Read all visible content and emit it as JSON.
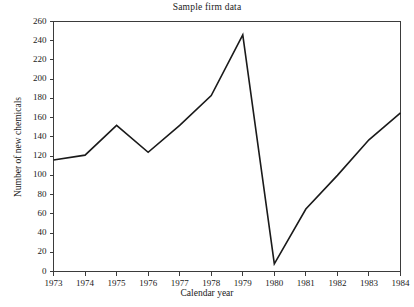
{
  "chart_data": {
    "type": "line",
    "title": "Sample firm data",
    "xlabel": "Calendar year",
    "ylabel": "Number of new chemicals",
    "categories": [
      1973,
      1974,
      1975,
      1976,
      1977,
      1978,
      1979,
      1980,
      1981,
      1982,
      1983,
      1984
    ],
    "values": [
      116,
      121,
      152,
      124,
      152,
      183,
      246,
      8,
      65,
      100,
      137,
      165
    ],
    "series": [
      {
        "name": "Number of new chemicals",
        "values": [
          116,
          121,
          152,
          124,
          152,
          183,
          246,
          8,
          65,
          100,
          137,
          165
        ]
      }
    ],
    "xlim": [
      1973,
      1984
    ],
    "ylim": [
      0,
      260
    ],
    "ytick_labels": [
      "0",
      "20",
      "40",
      "60",
      "80",
      "100",
      "120",
      "140",
      "160",
      "180",
      "200",
      "220",
      "240",
      "260"
    ],
    "ytick_values": [
      0,
      20,
      40,
      60,
      80,
      100,
      120,
      140,
      160,
      180,
      200,
      220,
      240,
      260
    ],
    "xtick_labels": [
      "1973",
      "1974",
      "1975",
      "1976",
      "1977",
      "1978",
      "1979",
      "1980",
      "1981",
      "1982",
      "1983",
      "1984"
    ],
    "xtick_values": [
      1973,
      1974,
      1975,
      1976,
      1977,
      1978,
      1979,
      1980,
      1981,
      1982,
      1983,
      1984
    ],
    "grid": false,
    "legend": false,
    "legend_position": "none",
    "line_color": "#1a1a1a",
    "axis_color": "#3b3b3b",
    "background_color": "#ffffff",
    "markers": false
  }
}
